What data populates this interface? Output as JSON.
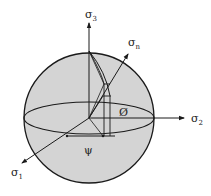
{
  "diagram": {
    "title": "",
    "colors": {
      "sphere_fill": "#d4d4d4",
      "stroke": "#1a1a1a",
      "background": "#ffffff"
    },
    "axes": {
      "sigma3": {
        "label": "σ",
        "subscript": "3"
      },
      "sigma2": {
        "label": "σ",
        "subscript": "2"
      },
      "sigma1": {
        "label": "σ",
        "subscript": "1"
      },
      "sigman": {
        "label": "σ",
        "subscript": "n"
      }
    },
    "angles": {
      "psi": "ψ",
      "phi": "Ø"
    }
  }
}
